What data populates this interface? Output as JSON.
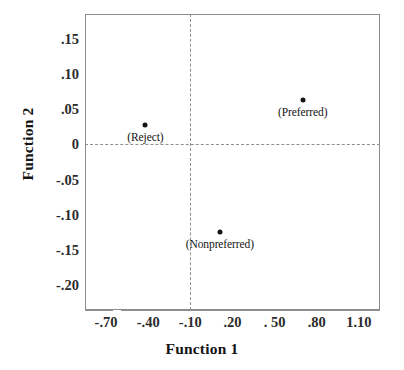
{
  "chart_data": {
    "type": "scatter",
    "title": "",
    "xlabel": "Function 1",
    "ylabel": "Function 2",
    "xlim": [
      -0.85,
      1.25
    ],
    "ylim": [
      -0.235,
      0.185
    ],
    "grid": false,
    "legend": "none",
    "xticks": [
      "-.70",
      "-.40",
      "-.10",
      ".20",
      ". 50",
      ".80",
      "1.10"
    ],
    "xtick_values": [
      -0.7,
      -0.4,
      -0.1,
      0.2,
      0.5,
      0.8,
      1.1
    ],
    "yticks": [
      ".15",
      ".10",
      ".05",
      "0",
      "-.05",
      "-.10",
      "-.15",
      "-.20"
    ],
    "ytick_values": [
      0.15,
      0.1,
      0.05,
      0,
      -0.05,
      -0.1,
      -0.15,
      -0.2
    ],
    "reference_lines": [
      {
        "axis": "horizontal",
        "value": 0,
        "style": "dashed"
      },
      {
        "axis": "vertical",
        "value": -0.1,
        "style": "dashed"
      }
    ],
    "points": [
      {
        "label": "(Reject)",
        "x": -0.42,
        "y": 0.028
      },
      {
        "label": "(Preferred)",
        "x": 0.7,
        "y": 0.063
      },
      {
        "label": "(Nonpreferred)",
        "x": 0.11,
        "y": -0.125
      }
    ]
  },
  "colors": {
    "point": "#141414",
    "frame": "#8d8d8d",
    "reference": "#8f8f8f",
    "text": "#141414",
    "background": "#ffffff"
  }
}
